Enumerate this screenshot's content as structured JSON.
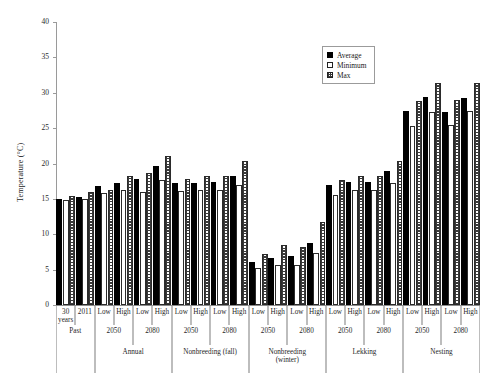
{
  "chart_data": {
    "type": "bar",
    "title": "",
    "xlabel": "",
    "ylabel": "Temperature (°C)",
    "ylim": [
      0,
      40
    ],
    "ytick_labels": [
      "0",
      "5",
      "10",
      "15",
      "20",
      "25",
      "30",
      "35",
      "40"
    ],
    "ytick_values": [
      0,
      5,
      10,
      15,
      20,
      25,
      30,
      35,
      40
    ],
    "grid": false,
    "legend_position": "upper-right",
    "legend": [
      "Average",
      "Minimum",
      "Max"
    ],
    "series": [
      {
        "name": "Average",
        "values": [
          15.0,
          15.2,
          16.8,
          17.2,
          17.8,
          19.6,
          17.2,
          17.2,
          17.4,
          18.2,
          6.1,
          6.6,
          6.9,
          8.7,
          16.9,
          17.4,
          17.4,
          19.0,
          27.4,
          29.4,
          27.3,
          29.3
        ]
      },
      {
        "name": "Minimum",
        "values": [
          14.8,
          15.0,
          15.9,
          16.2,
          16.0,
          17.7,
          16.1,
          16.2,
          16.2,
          17.0,
          5.2,
          5.6,
          5.7,
          7.4,
          15.6,
          16.2,
          16.3,
          17.3,
          25.3,
          27.3,
          25.4,
          27.4
        ]
      },
      {
        "name": "Max",
        "values": [
          15.4,
          16.0,
          16.3,
          18.2,
          18.7,
          21.0,
          17.8,
          18.2,
          18.2,
          20.4,
          7.2,
          8.5,
          8.2,
          11.8,
          17.6,
          18.2,
          18.2,
          20.3,
          28.9,
          31.4,
          29.0,
          31.4
        ]
      }
    ],
    "categories": [
      "30 years",
      "2011",
      "Low",
      "High",
      "Low",
      "High",
      "Low",
      "High",
      "Low",
      "High",
      "Low",
      "High",
      "Low",
      "High",
      "Low",
      "High",
      "Low",
      "High",
      "Low",
      "High",
      "Low",
      "High"
    ]
  },
  "axis": {
    "y_title": "Temperature (°C)",
    "y_ticks": [
      "40",
      "35",
      "30",
      "25",
      "20",
      "15",
      "10",
      "5",
      "0"
    ]
  },
  "legend": {
    "items": [
      {
        "label": "Average",
        "swatch": "solid-black-square-icon"
      },
      {
        "label": "Minimum",
        "swatch": "open-white-square-icon"
      },
      {
        "label": "Max",
        "swatch": "checkered-square-icon"
      }
    ]
  },
  "xaxis": {
    "tier1": [
      {
        "label": "30",
        "sub": "years",
        "span": 1
      },
      {
        "label": "2011",
        "sub": "",
        "span": 1
      },
      {
        "label": "Low",
        "sub": "",
        "span": 1
      },
      {
        "label": "High",
        "sub": "",
        "span": 1
      },
      {
        "label": "Low",
        "sub": "",
        "span": 1
      },
      {
        "label": "High",
        "sub": "",
        "span": 1
      },
      {
        "label": "Low",
        "sub": "",
        "span": 1
      },
      {
        "label": "High",
        "sub": "",
        "span": 1
      },
      {
        "label": "Low",
        "sub": "",
        "span": 1
      },
      {
        "label": "High",
        "sub": "",
        "span": 1
      },
      {
        "label": "Low",
        "sub": "",
        "span": 1
      },
      {
        "label": "High",
        "sub": "",
        "span": 1
      },
      {
        "label": "Low",
        "sub": "",
        "span": 1
      },
      {
        "label": "High",
        "sub": "",
        "span": 1
      },
      {
        "label": "Low",
        "sub": "",
        "span": 1
      },
      {
        "label": "High",
        "sub": "",
        "span": 1
      },
      {
        "label": "Low",
        "sub": "",
        "span": 1
      },
      {
        "label": "High",
        "sub": "",
        "span": 1
      },
      {
        "label": "Low",
        "sub": "",
        "span": 1
      },
      {
        "label": "High",
        "sub": "",
        "span": 1
      },
      {
        "label": "Low",
        "sub": "",
        "span": 1
      },
      {
        "label": "High",
        "sub": "",
        "span": 1
      }
    ],
    "tier2": [
      {
        "label": "Past",
        "span": 2
      },
      {
        "label": "2050",
        "span": 2
      },
      {
        "label": "2080",
        "span": 2
      },
      {
        "label": "2050",
        "span": 2
      },
      {
        "label": "2080",
        "span": 2
      },
      {
        "label": "2050",
        "span": 2
      },
      {
        "label": "2080",
        "span": 2
      },
      {
        "label": "2050",
        "span": 2
      },
      {
        "label": "2080",
        "span": 2
      },
      {
        "label": "2050",
        "span": 2
      },
      {
        "label": "2080",
        "span": 2
      }
    ],
    "tier3": [
      {
        "label": "",
        "sub": "",
        "span": 2
      },
      {
        "label": "Annual",
        "sub": "",
        "span": 4
      },
      {
        "label": "Nonbreeding (fall)",
        "sub": "",
        "span": 4
      },
      {
        "label": "Nonbreeding",
        "sub": "(winter)",
        "span": 4
      },
      {
        "label": "Lekking",
        "sub": "",
        "span": 4
      },
      {
        "label": "Nesting",
        "sub": "",
        "span": 4
      }
    ]
  },
  "colors": {
    "average": "#000000",
    "minimum": "#ffffff",
    "max_hatch": "#3a3a3a",
    "axis": "#9a9a9a",
    "text": "#1a1a1a"
  }
}
